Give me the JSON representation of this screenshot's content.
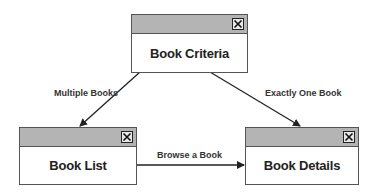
{
  "diagram": {
    "nodes": [
      {
        "id": "book-criteria",
        "label": "Book Criteria",
        "close_icon": "close-icon"
      },
      {
        "id": "book-list",
        "label": "Book List",
        "close_icon": "close-icon"
      },
      {
        "id": "book-details",
        "label": "Book Details",
        "close_icon": "close-icon"
      }
    ],
    "edges": [
      {
        "from": "book-criteria",
        "to": "book-list",
        "label": "Multiple Books"
      },
      {
        "from": "book-criteria",
        "to": "book-details",
        "label": "Exactly One Book"
      },
      {
        "from": "book-list",
        "to": "book-details",
        "label": "Browse a Book"
      }
    ],
    "colors": {
      "titlebar": "#b4b4b4",
      "border": "#555555",
      "arrow": "#222222"
    }
  }
}
